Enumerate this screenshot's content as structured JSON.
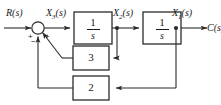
{
  "diagram": {
    "type": "signal-flow-block-diagram",
    "stroke_color": "#2b2b2b",
    "text_color": "#1a1a1a",
    "background": "#ffffff",
    "signals": {
      "input": "R(s)",
      "input_base": "R",
      "input_suffix": "(s)",
      "node3_base": "X",
      "node3_sub": "3",
      "node3_suffix": "(s)",
      "node2_base": "X",
      "node2_sub": "2",
      "node2_suffix": "(s)",
      "node1_base": "X",
      "node1_sub": "1",
      "node1_suffix": "(s)",
      "output_base": "C",
      "output_suffix": "(s)"
    },
    "summing_junction": {
      "name": "summing-junction",
      "sign_input": "+",
      "sign_feedback_outer": "−",
      "sign_feedback_inner": "+"
    },
    "blocks": [
      {
        "id": "integrator-1",
        "numerator": "1",
        "denominator": "s",
        "label": "1/s"
      },
      {
        "id": "integrator-2",
        "numerator": "1",
        "denominator": "s",
        "label": "1/s"
      },
      {
        "id": "gain-3",
        "gain": "3"
      },
      {
        "id": "gain-2",
        "gain": "2"
      }
    ]
  }
}
